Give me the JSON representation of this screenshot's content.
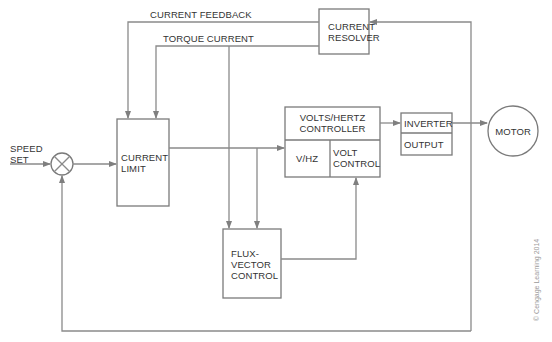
{
  "diagram": {
    "type": "block-diagram",
    "signals": {
      "current_feedback": "CURRENT FEEDBACK",
      "torque_current": "TORQUE CURRENT",
      "speed_set": [
        "SPEED",
        "SET"
      ]
    },
    "blocks": {
      "current_resolver": [
        "CURRENT",
        "RESOLVER"
      ],
      "current_limit": [
        "CURRENT",
        "LIMIT"
      ],
      "vhz_controller": {
        "title": [
          "VOLTS/HERTZ",
          "CONTROLLER"
        ],
        "left": "V/HZ",
        "right": [
          "VOLT",
          "CONTROL"
        ]
      },
      "inverter": {
        "top": "INVERTER",
        "bottom": "OUTPUT"
      },
      "flux_vector": [
        "FLUX-",
        "VECTOR",
        "CONTROL"
      ],
      "motor": "MOTOR",
      "summing_junction": "summing-junction"
    },
    "connections": [
      {
        "from": "speed_set",
        "to": "summing_junction"
      },
      {
        "from": "summing_junction",
        "to": "current_limit"
      },
      {
        "from": "current_limit",
        "to": "vhz_controller"
      },
      {
        "from": "current_limit",
        "to": "flux_vector"
      },
      {
        "from": "flux_vector",
        "to": "vhz_controller.volt_control"
      },
      {
        "from": "vhz_controller",
        "to": "inverter"
      },
      {
        "from": "inverter",
        "to": "motor"
      },
      {
        "from": "motor_line",
        "to": "current_resolver"
      },
      {
        "from": "current_resolver",
        "to": "current_limit",
        "label": "CURRENT FEEDBACK"
      },
      {
        "from": "current_resolver",
        "to": "current_limit",
        "label": "TORQUE CURRENT"
      },
      {
        "from": "current_resolver",
        "to": "flux_vector",
        "label": "TORQUE CURRENT"
      },
      {
        "from": "motor_line",
        "to": "summing_junction",
        "label": "speed feedback"
      }
    ],
    "copyright": "© Cengage Learning 2014"
  },
  "colors": {
    "line": "#8a8a8a",
    "box": "#7a7a7a",
    "text": "#333333"
  }
}
